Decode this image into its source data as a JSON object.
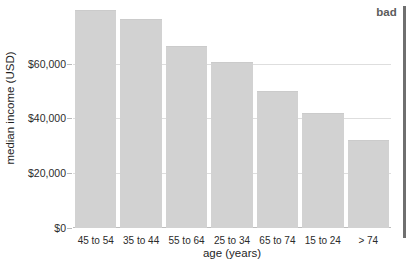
{
  "annotation": {
    "marker_label": "bad"
  },
  "chart_data": {
    "type": "bar",
    "title": "",
    "subtitle": "",
    "xlabel": "age (years)",
    "ylabel": "median income (USD)",
    "categories": [
      "45 to 54",
      "35 to 44",
      "55 to 64",
      "25 to 34",
      "65 to 74",
      "15 to 24",
      "> 74"
    ],
    "values": [
      79000,
      76000,
      66000,
      60300,
      49700,
      41700,
      31800
    ],
    "ytick_labels": [
      "$0",
      "$20,000",
      "$40,000",
      "$60,000"
    ],
    "ytick_values": [
      0,
      20000,
      40000,
      60000
    ],
    "ylim": [
      0,
      81000
    ],
    "grid": "horizontal",
    "legend": "none",
    "bar_color": "#d2d2d2",
    "gridline_color": "#dedede",
    "text_color": "#2b2b2b",
    "annotations": [
      "bad"
    ]
  }
}
